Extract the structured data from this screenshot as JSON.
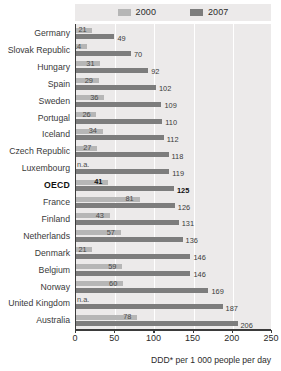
{
  "legend": {
    "entries": [
      {
        "label": "2000",
        "color": "#b6b6b6"
      },
      {
        "label": "2007",
        "color": "#7d7d7d"
      }
    ]
  },
  "axis": {
    "title": "DDD* per 1 000 people per day",
    "ticks": [
      "0",
      "50",
      "100",
      "150",
      "200",
      "250"
    ]
  },
  "chart_data": {
    "type": "bar",
    "orientation": "horizontal",
    "title": "",
    "subtitle": "",
    "xlabel": "DDD* per 1 000 people per day",
    "ylabel": "",
    "xlim": [
      0,
      250
    ],
    "grid": true,
    "legend_position": "top",
    "categories": [
      "Germany",
      "Slovak Republic",
      "Hungary",
      "Spain",
      "Sweden",
      "Portugal",
      "Iceland",
      "Czech Republic",
      "Luxembourg",
      "OECD",
      "France",
      "Finland",
      "Netherlands",
      "Denmark",
      "Belgium",
      "Norway",
      "United Kingdom",
      "Australia"
    ],
    "highlight_category": "OECD",
    "na_label": "n.a.",
    "series": [
      {
        "name": "2000",
        "color": "#b6b6b6",
        "values": [
          21,
          14,
          31,
          29,
          36,
          26,
          34,
          27,
          null,
          41,
          81,
          43,
          57,
          21,
          59,
          60,
          null,
          78
        ],
        "labels": [
          "21",
          "14",
          "31",
          "29",
          "36",
          "26",
          "34",
          "27",
          "n.a.",
          "41",
          "81",
          "43",
          "57",
          "21",
          "59",
          "60",
          "n.a.",
          "78"
        ]
      },
      {
        "name": "2007",
        "color": "#7d7d7d",
        "values": [
          49,
          70,
          92,
          102,
          109,
          110,
          112,
          118,
          119,
          125,
          126,
          131,
          136,
          146,
          146,
          169,
          187,
          206
        ],
        "labels": [
          "49",
          "70",
          "92",
          "102",
          "109",
          "110",
          "112",
          "118",
          "119",
          "125",
          "126",
          "131",
          "136",
          "146",
          "146",
          "169",
          "187",
          "206"
        ]
      }
    ]
  }
}
